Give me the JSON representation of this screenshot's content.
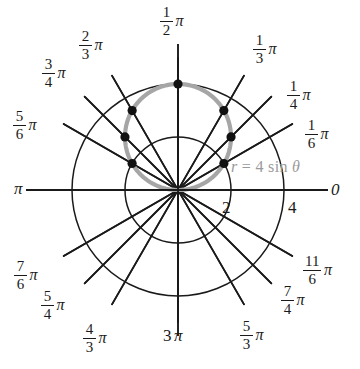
{
  "figure": {
    "equation_label": {
      "r": "r",
      "equals": "=",
      "coefficient": "4",
      "function": "sin",
      "variable": "θ",
      "full": "r = 4 sin θ",
      "color": "#9a9a9a"
    },
    "colors": {
      "curve": "#a6a6a6",
      "grid": "#1a1a1a",
      "point": "#111111",
      "background": "#ffffff"
    }
  },
  "axis_labels": {
    "zero": "0",
    "pi": "π",
    "bottom": "3",
    "bottom_pi": "π"
  },
  "radial_ticks": [
    {
      "value": "2",
      "r": 2
    },
    {
      "value": "4",
      "r": 4
    }
  ],
  "angle_labels": [
    {
      "num": "1",
      "den": "2",
      "pi": "π",
      "theta_deg": 90,
      "x": 160,
      "y": 4
    },
    {
      "num": "1",
      "den": "3",
      "pi": "π",
      "theta_deg": 60,
      "x": 253,
      "y": 32
    },
    {
      "num": "1",
      "den": "4",
      "pi": "π",
      "theta_deg": 45,
      "x": 287,
      "y": 78
    },
    {
      "num": "1",
      "den": "6",
      "pi": "π",
      "theta_deg": 30,
      "x": 305,
      "y": 117
    },
    {
      "num": "2",
      "den": "3",
      "pi": "π",
      "theta_deg": 120,
      "x": 79,
      "y": 28
    },
    {
      "num": "3",
      "den": "4",
      "pi": "π",
      "theta_deg": 135,
      "x": 42,
      "y": 56
    },
    {
      "num": "5",
      "den": "6",
      "pi": "π",
      "theta_deg": 150,
      "x": 13,
      "y": 108
    },
    {
      "num": "7",
      "den": "6",
      "pi": "π",
      "theta_deg": 210,
      "x": 14,
      "y": 258
    },
    {
      "num": "5",
      "den": "4",
      "pi": "π",
      "theta_deg": 225,
      "x": 41,
      "y": 288
    },
    {
      "num": "4",
      "den": "3",
      "pi": "π",
      "theta_deg": 240,
      "x": 83,
      "y": 321
    },
    {
      "num": "5",
      "den": "3",
      "pi": "π",
      "theta_deg": 300,
      "x": 240,
      "y": 318
    },
    {
      "num": "7",
      "den": "4",
      "pi": "π",
      "theta_deg": 315,
      "x": 281,
      "y": 283
    },
    {
      "num": "11",
      "den": "6",
      "pi": "π",
      "theta_deg": 330,
      "x": 303,
      "y": 253
    }
  ],
  "chart_data": {
    "type": "line",
    "plot_kind": "polar",
    "title": "r = 4 sin θ",
    "equation": "r = 4 sin(theta)",
    "xlabel": "θ",
    "ylabel": "r",
    "rlim": [
      0,
      4
    ],
    "r_ticks": [
      2,
      4
    ],
    "theta_ticks_deg": [
      0,
      30,
      45,
      60,
      90,
      120,
      135,
      150,
      180,
      210,
      225,
      240,
      270,
      300,
      315,
      330
    ],
    "theta_tick_labels": [
      "0",
      "1/6 π",
      "1/4 π",
      "1/3 π",
      "1/2 π",
      "2/3 π",
      "3/4 π",
      "5/6 π",
      "π",
      "7/6 π",
      "5/4 π",
      "4/3 π",
      "3/2 π",
      "5/3 π",
      "7/4 π",
      "11/6 π"
    ],
    "grid": true,
    "legend": false,
    "series": [
      {
        "name": "r = 4 sin θ",
        "color": "#a6a6a6",
        "marked_points": [
          {
            "theta_label": "1/6 π",
            "theta_deg": 30,
            "r": 2.0
          },
          {
            "theta_label": "1/4 π",
            "theta_deg": 45,
            "r": 2.83
          },
          {
            "theta_label": "1/3 π",
            "theta_deg": 60,
            "r": 3.46
          },
          {
            "theta_label": "1/2 π",
            "theta_deg": 90,
            "r": 4.0
          },
          {
            "theta_label": "2/3 π",
            "theta_deg": 120,
            "r": 3.46
          },
          {
            "theta_label": "3/4 π",
            "theta_deg": 135,
            "r": 2.83
          },
          {
            "theta_label": "5/6 π",
            "theta_deg": 150,
            "r": 2.0
          }
        ]
      }
    ]
  },
  "geometry": {
    "center_x": 178,
    "center_y": 190,
    "r_outer_px": 106,
    "r_inner_px": 56,
    "spoke_overshoot_px": 26
  }
}
